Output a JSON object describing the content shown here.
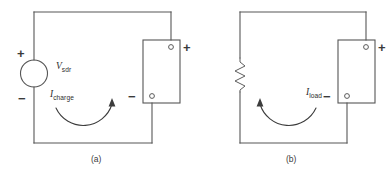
{
  "figure": {
    "background_color": "#ffffff",
    "line_color": "#565656",
    "text_color": "#2e2e2e"
  },
  "panels": [
    {
      "id": "a",
      "caption": "(a)",
      "source": {
        "type": "voltage-source",
        "label_symbol": "V",
        "label_subscript": "sdr",
        "plus_sign": "+",
        "minus_sign": "−"
      },
      "battery": {
        "plus_sign": "+",
        "minus_sign": "−"
      },
      "current": {
        "label_symbol": "I",
        "label_subscript": "charge",
        "direction": "clockwise"
      }
    },
    {
      "id": "b",
      "caption": "(b)",
      "source": {
        "type": "resistor"
      },
      "battery": {
        "plus_sign": "+",
        "minus_sign": "−"
      },
      "current": {
        "label_symbol": "I",
        "label_subscript": "load",
        "direction": "counter-clockwise"
      }
    }
  ]
}
